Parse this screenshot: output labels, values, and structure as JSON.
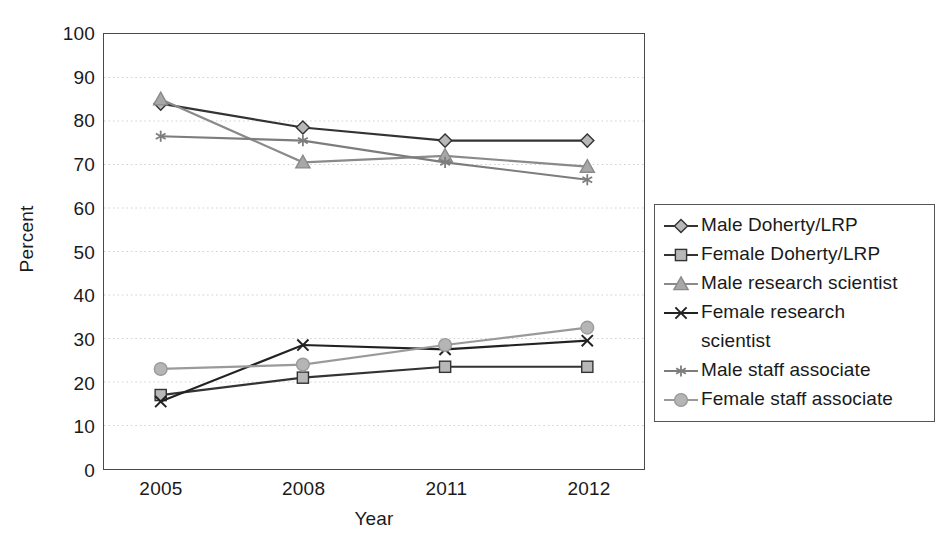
{
  "chart_data": {
    "type": "line",
    "title": "",
    "xlabel": "Year",
    "ylabel": "Percent",
    "categories": [
      "2005",
      "2008",
      "2011",
      "2012"
    ],
    "ylim": [
      0,
      100
    ],
    "ytick_step": 10,
    "yticks": [
      0,
      10,
      20,
      30,
      40,
      50,
      60,
      70,
      80,
      90,
      100
    ],
    "grid": "horizontal-dotted",
    "legend_position": "right",
    "series": [
      {
        "name": "Male Doherty/LRP",
        "marker": "diamond",
        "color": "#333333",
        "marker_fill": "#b8b8b8",
        "values": [
          84.0,
          78.5,
          75.5,
          75.5
        ]
      },
      {
        "name": "Female Doherty/LRP",
        "marker": "square",
        "color": "#333333",
        "marker_fill": "#b8b8b8",
        "values": [
          17.0,
          21.0,
          23.5,
          23.5
        ]
      },
      {
        "name": "Male research scientist",
        "marker": "triangle",
        "color": "#8a8a8a",
        "marker_fill": "#a8a8a8",
        "values": [
          85.0,
          70.5,
          72.0,
          69.5
        ]
      },
      {
        "name": "Female research scientist",
        "marker": "x",
        "color": "#222222",
        "marker_fill": "#222222",
        "values": [
          15.5,
          28.5,
          27.5,
          29.5
        ]
      },
      {
        "name": "Male staff associate",
        "marker": "asterisk",
        "color": "#7d7d7d",
        "marker_fill": "#7d7d7d",
        "values": [
          76.5,
          75.5,
          70.5,
          66.5
        ]
      },
      {
        "name": "Female staff associate",
        "marker": "circle",
        "color": "#9a9a9a",
        "marker_fill": "#b5b5b5",
        "values": [
          23.0,
          24.0,
          28.5,
          32.5
        ]
      }
    ]
  },
  "legend": {
    "entries": [
      {
        "label": "Male Doherty/LRP",
        "wrap": null
      },
      {
        "label": "Female Doherty/LRP",
        "wrap": null
      },
      {
        "label": "Male research scientist",
        "wrap": null
      },
      {
        "label": "Female research",
        "wrap": "scientist"
      },
      {
        "label": "Male staff associate",
        "wrap": null
      },
      {
        "label": "Female staff associate",
        "wrap": null
      }
    ]
  },
  "axes": {
    "y_title": "Percent",
    "x_title": "Year",
    "y_tick_labels": [
      "100",
      "90",
      "80",
      "70",
      "60",
      "50",
      "40",
      "30",
      "20",
      "10",
      "0"
    ],
    "x_tick_labels": [
      "2005",
      "2008",
      "2011",
      "2012"
    ]
  },
  "colors": {
    "frame": "#4a4a4a",
    "grid": "#cfcfcf",
    "text": "#1a1a1a",
    "dark_series": "#333333",
    "grey_series": "#8a8a8a"
  }
}
